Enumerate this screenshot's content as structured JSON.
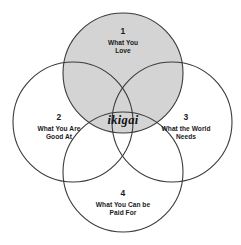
{
  "diagram": {
    "type": "venn-4-circle",
    "title_center": "ikigai",
    "background_color": "#ffffff",
    "stroke_color": "#3b3b3b",
    "shaded_fill_color": "#d4d4d4",
    "unshaded_fill_color": "#ffffff",
    "circles": [
      {
        "id": "love",
        "number": "1",
        "line1": "What You",
        "line2": "Love",
        "shaded": true,
        "position": "top",
        "cx": 123,
        "cy": 73,
        "r": 60
      },
      {
        "id": "good-at",
        "number": "2",
        "line1": "What You Are",
        "line2": "Good At",
        "shaded": false,
        "position": "left",
        "cx": 73,
        "cy": 122,
        "r": 60
      },
      {
        "id": "world-needs",
        "number": "3",
        "line1": "What the World",
        "line2": "Needs",
        "shaded": false,
        "position": "right",
        "cx": 172,
        "cy": 122,
        "r": 60
      },
      {
        "id": "paid-for",
        "number": "4",
        "line1": "What You Can be",
        "line2": "Paid For",
        "shaded": false,
        "position": "bottom",
        "cx": 123,
        "cy": 172,
        "r": 60
      }
    ]
  }
}
